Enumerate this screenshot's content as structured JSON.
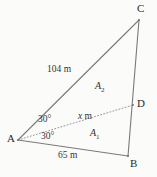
{
  "figure": {
    "type": "geometry-diagram",
    "background_color": "#fbfbfa",
    "stroke_color": "#6e6e6e",
    "text_color": "#333333",
    "width": 157,
    "height": 177
  },
  "vertices": [
    {
      "id": "A",
      "label": "A",
      "x": 18,
      "y": 140,
      "label_x": 7,
      "label_y": 134
    },
    {
      "id": "B",
      "label": "B",
      "x": 128,
      "y": 156,
      "label_x": 130,
      "label_y": 158
    },
    {
      "id": "C",
      "label": "C",
      "x": 139,
      "y": 20,
      "label_x": 138,
      "label_y": 3
    },
    {
      "id": "D",
      "label": "D",
      "x": 133,
      "y": 105,
      "label_x": 137,
      "label_y": 98
    }
  ],
  "edges": [
    {
      "id": "AC",
      "from": "A",
      "to": "C",
      "style": "solid"
    },
    {
      "id": "CB",
      "from": "C",
      "to": "B",
      "style": "solid"
    },
    {
      "id": "AB",
      "from": "A",
      "to": "B",
      "style": "solid"
    },
    {
      "id": "AD",
      "from": "A",
      "to": "D",
      "style": "dotted"
    }
  ],
  "measurements": [
    {
      "id": "side-ac",
      "text": "104 m",
      "x": 47,
      "y": 66
    },
    {
      "id": "side-ab",
      "text": "65 m",
      "x": 58,
      "y": 152
    },
    {
      "id": "segment-ad",
      "prefix": "x",
      "suffix": " m",
      "x": 78,
      "y": 113
    }
  ],
  "angles": [
    {
      "id": "angle-dac",
      "text": "30°",
      "x": 38,
      "y": 116
    },
    {
      "id": "angle-dab",
      "text": "30°",
      "x": 41,
      "y": 133
    }
  ],
  "areas": [
    {
      "id": "area-upper",
      "label": "A",
      "subscript": "2",
      "x": 95,
      "y": 82
    },
    {
      "id": "area-lower",
      "label": "A",
      "subscript": "1",
      "x": 90,
      "y": 129
    }
  ]
}
